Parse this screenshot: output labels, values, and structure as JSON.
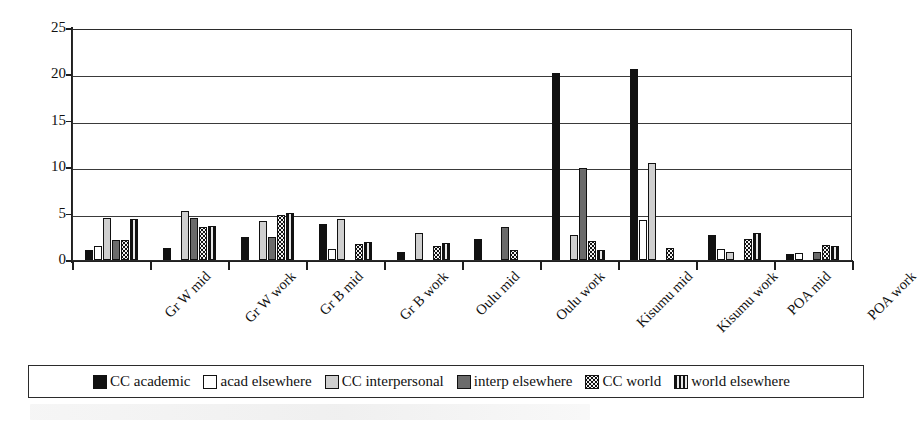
{
  "chart_data": {
    "type": "bar",
    "title": "",
    "xlabel": "",
    "ylabel": "% of observations",
    "ylim": [
      0,
      25
    ],
    "yticks": [
      0,
      5,
      10,
      15,
      20,
      25
    ],
    "grid": true,
    "legend_position": "bottom",
    "categories": [
      "Gr W mid",
      "Gr W work",
      "Gr B mid",
      "Gr B work",
      "Oulu mid",
      "Oulu work",
      "Kisumu mid",
      "Kisumu work",
      "POA mid",
      "POA work"
    ],
    "series": [
      {
        "name": "CC academic",
        "pattern": "solid-black",
        "color": "#111111",
        "values": [
          1.1,
          1.3,
          2.5,
          3.9,
          0.9,
          2.3,
          20.1,
          20.6,
          2.7,
          0.7
        ]
      },
      {
        "name": "acad elsewhere",
        "pattern": "white",
        "color": "#ffffff",
        "values": [
          1.5,
          0.0,
          0.0,
          1.2,
          0.0,
          0.0,
          0.0,
          4.3,
          1.2,
          0.8
        ]
      },
      {
        "name": "CC interpersonal",
        "pattern": "light-gray",
        "color": "#cfcfcf",
        "values": [
          4.5,
          5.3,
          4.2,
          4.4,
          2.9,
          0.0,
          2.7,
          10.5,
          0.9,
          0.0
        ]
      },
      {
        "name": "interp elsewhere",
        "pattern": "dark-gray",
        "color": "#6b6b6b",
        "values": [
          2.2,
          4.5,
          2.5,
          0.0,
          0.0,
          3.6,
          9.9,
          0.0,
          0.0,
          0.9
        ]
      },
      {
        "name": "CC world",
        "pattern": "dotted-grid",
        "color": "#f2f2f2",
        "values": [
          2.2,
          3.6,
          4.9,
          1.7,
          1.5,
          1.1,
          2.0,
          1.3,
          2.3,
          1.6
        ]
      },
      {
        "name": "world elsewhere",
        "pattern": "vertical-stripes",
        "color": "#e8e8e8",
        "values": [
          4.4,
          3.7,
          5.1,
          1.9,
          1.8,
          0.0,
          1.1,
          0.0,
          2.9,
          1.5
        ]
      }
    ]
  },
  "axis": {
    "y_label": "% of observations",
    "y_tick_labels": [
      "25",
      "20",
      "15",
      "10",
      "5",
      "0"
    ]
  },
  "legend": {
    "entries": [
      {
        "label": "CC academic"
      },
      {
        "label": "acad elsewhere"
      },
      {
        "label": "CC interpersonal"
      },
      {
        "label": "interp elsewhere"
      },
      {
        "label": "CC world"
      },
      {
        "label": "world elsewhere"
      }
    ]
  }
}
